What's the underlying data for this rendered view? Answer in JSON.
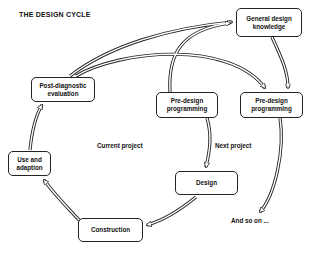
{
  "title": "THE DESIGN CYCLE",
  "nodes": {
    "general_knowledge": "General design knowledge",
    "predesign_current": "Pre-design programming",
    "predesign_next": "Pre-design programming",
    "post_diagnostic": "Post-diagnostic evaluation",
    "use_adaption": "Use and adaption",
    "construction": "Construction",
    "design": "Design"
  },
  "labels": {
    "current_project": "Current project",
    "next_project": "Next project",
    "and_so_on": "And so on ..."
  },
  "edges": [
    {
      "from": "Post-diagnostic evaluation",
      "to": "General design knowledge"
    },
    {
      "from": "Post-diagnostic evaluation",
      "to": "Pre-design programming (next)"
    },
    {
      "from": "Pre-design programming (current)",
      "to": "General design knowledge"
    },
    {
      "from": "General design knowledge",
      "to": "Pre-design programming (next)"
    },
    {
      "from": "Pre-design programming (current)",
      "to": "Design"
    },
    {
      "from": "Design",
      "to": "Construction"
    },
    {
      "from": "Construction",
      "to": "Use and adaption"
    },
    {
      "from": "Use and adaption",
      "to": "Post-diagnostic evaluation"
    },
    {
      "from": "Pre-design programming (next)",
      "to": "And so on ..."
    }
  ]
}
